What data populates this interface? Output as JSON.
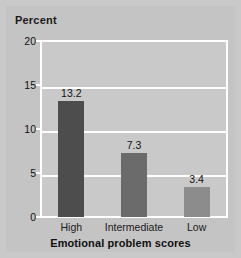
{
  "chart_data": {
    "type": "bar",
    "title": "",
    "categories": [
      "High",
      "Intermediate",
      "Low"
    ],
    "values": [
      13.2,
      7.3,
      3.4
    ],
    "value_labels": [
      "13.2",
      "7.3",
      "3.4"
    ],
    "xlabel": "Emotional problem scores",
    "ylabel": "Percent",
    "ylim": [
      0,
      20
    ],
    "yticks": [
      0,
      5,
      10,
      15,
      20
    ],
    "ytick_labels": [
      "0",
      "5",
      "10",
      "15",
      "20"
    ],
    "grid": "horizontal",
    "legend": "none",
    "bar_colors": [
      "#4d4d4d",
      "#6b6b6b",
      "#8c8c8c"
    ],
    "plot_background": "#c9c9c9",
    "figure_background": "#c4c4c4",
    "gridline_color": "#ffffff"
  },
  "axes": {
    "y_title": "Percent",
    "x_title": "Emotional problem scores"
  }
}
